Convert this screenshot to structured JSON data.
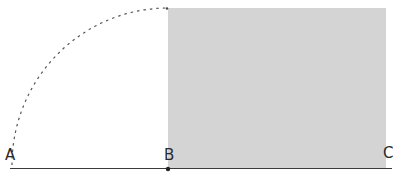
{
  "diagram": {
    "type": "geometric-construction",
    "points": [
      {
        "id": "A",
        "label": "A",
        "x": 12,
        "y": 167
      },
      {
        "id": "B",
        "label": "B",
        "x": 168,
        "y": 169
      },
      {
        "id": "C",
        "label": "C",
        "x": 388,
        "y": 167
      }
    ],
    "shaded_rect": {
      "x": 168,
      "y": 8,
      "width": 218,
      "height": 160,
      "fill": "#d2d2d2"
    },
    "arc": {
      "from": "A",
      "to_x": 168,
      "to_y": 8,
      "center": "B",
      "style": "dashed",
      "color": "#555555"
    },
    "baseline": {
      "x1": 10,
      "y1": 168,
      "x2": 392,
      "y2": 168,
      "color": "#333333"
    }
  },
  "labels": {
    "a": "A",
    "b": "B",
    "c": "C"
  }
}
